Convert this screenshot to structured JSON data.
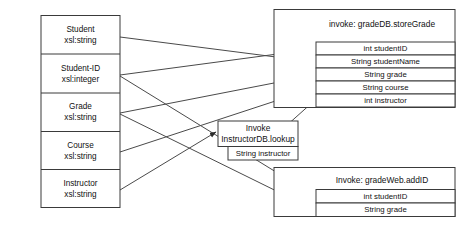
{
  "diagram": {
    "type": "mapping-diagram",
    "colors": {
      "background": "#ffffff",
      "stroke": "#3a3a3a",
      "connector": "#4a4a4a",
      "text": "#111111"
    },
    "source_box": {
      "name": "source-schema-box",
      "fields": [
        {
          "name": "Student",
          "type": "xsl:string"
        },
        {
          "name": "Student-ID",
          "type": "xsl:integer"
        },
        {
          "name": "Grade",
          "type": "xsl:string"
        },
        {
          "name": "Course",
          "type": "xsl:string"
        },
        {
          "name": "Instructor",
          "type": "xsl:string"
        }
      ]
    },
    "target_boxes": [
      {
        "id": "gradedb",
        "header": "invoke: gradeDB.storeGrade",
        "rows": [
          "int studentID",
          "String studentName",
          "String grade",
          "String course",
          "int instructor"
        ]
      },
      {
        "id": "instructordb",
        "header_line1": "Invoke",
        "header_line2": "InstructorDB.lookup",
        "rows": [
          "String instructor"
        ]
      },
      {
        "id": "gradeweb",
        "header": "Invoke: gradeWeb.addID",
        "rows": [
          "int studentID",
          "String grade"
        ]
      }
    ],
    "connections": [
      {
        "from": "Student",
        "to": "String studentName"
      },
      {
        "from": "Student-ID",
        "to": "int studentID"
      },
      {
        "from": "Student-ID",
        "to": "int studentID (gradeWeb)"
      },
      {
        "from": "Grade",
        "to": "String grade"
      },
      {
        "from": "Grade",
        "to": "String grade (gradeWeb)"
      },
      {
        "from": "Course",
        "to": "String course"
      },
      {
        "from": "Instructor",
        "to": "Invoke InstructorDB.lookup"
      },
      {
        "from": "String instructor",
        "to": "int instructor"
      }
    ]
  }
}
